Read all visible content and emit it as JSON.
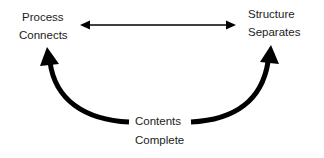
{
  "diagram": {
    "nodes": {
      "top_left": {
        "title": "Process",
        "subtitle": "Connects"
      },
      "top_right": {
        "title": "Structure",
        "subtitle": "Separates"
      },
      "bottom": {
        "title": "Contents",
        "subtitle": "Complete"
      }
    },
    "edges": [
      {
        "from": "top_left",
        "to": "top_right",
        "type": "bidirectional-arrow",
        "style": "thin"
      },
      {
        "from": "bottom",
        "to": "top_left",
        "type": "curved-arrow",
        "style": "thick"
      },
      {
        "from": "bottom",
        "to": "top_right",
        "type": "curved-arrow",
        "style": "thick"
      }
    ],
    "colors": {
      "stroke": "#000000",
      "text": "#1c1c1c",
      "background": "#ffffff"
    }
  }
}
